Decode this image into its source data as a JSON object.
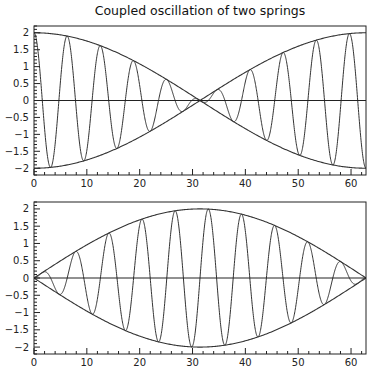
{
  "chart_data": [
    {
      "type": "line",
      "title": "Coupled oscillation of two springs",
      "xlabel": "",
      "ylabel": "",
      "xlim": [
        0,
        62.83
      ],
      "ylim": [
        -2.2,
        2.2
      ],
      "x_ticks": [
        0,
        10,
        20,
        30,
        40,
        50,
        60
      ],
      "x_tick_labels": [
        "0",
        "10",
        "20",
        "30",
        "40",
        "50",
        "60"
      ],
      "y_ticks": [
        -2,
        -1.5,
        -1,
        -0.5,
        0,
        0.5,
        1,
        1.5,
        2
      ],
      "y_tick_labels": [
        "-2",
        "-1.5",
        "-1",
        "-0.5",
        "0",
        "0.5",
        "1",
        "1.5",
        "2"
      ],
      "grid": false,
      "legend": null,
      "series": [
        {
          "name": "oscillation",
          "formula": "2*cos(x/20)*cos(x)",
          "kind": "carrier"
        },
        {
          "name": "upper envelope",
          "formula": "2*cos(x/20)",
          "kind": "envelope"
        },
        {
          "name": "lower envelope",
          "formula": "-2*cos(x/20)",
          "kind": "envelope"
        },
        {
          "name": "zero line",
          "formula": "0",
          "kind": "baseline"
        }
      ],
      "sample_points": {
        "x": [
          0,
          10,
          15.7,
          20,
          31.4,
          40,
          47.1,
          50,
          62.8
        ],
        "envelope": [
          2.0,
          1.76,
          1.41,
          1.08,
          0.0,
          -0.83,
          -1.41,
          -1.68,
          -2.0
        ]
      }
    },
    {
      "type": "line",
      "title": "",
      "xlabel": "",
      "ylabel": "",
      "xlim": [
        0,
        62.83
      ],
      "ylim": [
        -2.2,
        2.2
      ],
      "x_ticks": [
        0,
        10,
        20,
        30,
        40,
        50,
        60
      ],
      "x_tick_labels": [
        "0",
        "10",
        "20",
        "30",
        "40",
        "50",
        "60"
      ],
      "y_ticks": [
        -2,
        -1.5,
        -1,
        -0.5,
        0,
        0.5,
        1,
        1.5,
        2
      ],
      "y_tick_labels": [
        "-2",
        "-1.5",
        "-1",
        "-0.5",
        "0",
        "0.5",
        "1",
        "1.5",
        "2"
      ],
      "grid": false,
      "legend": null,
      "series": [
        {
          "name": "oscillation",
          "formula": "2*sin(x/20)*sin(x)",
          "kind": "carrier"
        },
        {
          "name": "upper envelope",
          "formula": "2*sin(x/20)",
          "kind": "envelope"
        },
        {
          "name": "lower envelope",
          "formula": "-2*sin(x/20)",
          "kind": "envelope"
        },
        {
          "name": "zero line",
          "formula": "0",
          "kind": "baseline"
        }
      ],
      "sample_points": {
        "x": [
          0,
          10,
          15.7,
          20,
          31.4,
          40,
          47.1,
          50,
          62.8
        ],
        "envelope": [
          0.0,
          0.96,
          1.41,
          1.68,
          2.0,
          1.82,
          1.41,
          1.2,
          0.0
        ]
      }
    }
  ],
  "figure": {
    "title": "Coupled oscillation of two springs"
  }
}
